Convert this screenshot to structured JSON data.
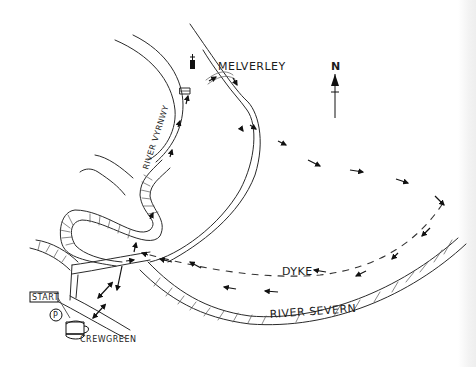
{
  "map": {
    "type": "hand-drawn walking route map",
    "labels": {
      "village_north": "MELVERLEY",
      "village_south": "CREWGREEN",
      "start": "START",
      "parking": "P",
      "dyke": "DYKE",
      "river_main": "RIVER SEVERN",
      "river_tributary": "RIVER VYRNWY",
      "north": "N"
    },
    "icons": [
      "church-icon",
      "parking-icon",
      "pub-icon",
      "north-arrow-icon",
      "bridge-icon"
    ],
    "colors": {
      "ink": "#2a2a2a",
      "background": "#ffffff"
    }
  }
}
